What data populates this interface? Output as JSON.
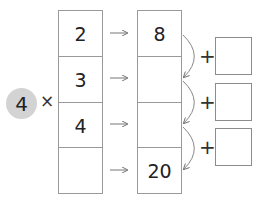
{
  "multiplier": {
    "value": "4",
    "operator": "×"
  },
  "left_column": [
    "2",
    "3",
    "4",
    ""
  ],
  "right_column": [
    "8",
    "",
    "",
    "20"
  ],
  "arrow_glyph": "→",
  "addition_boxes": [
    {
      "operator": "+",
      "value": ""
    },
    {
      "operator": "+",
      "value": ""
    },
    {
      "operator": "+",
      "value": ""
    }
  ],
  "colors": {
    "circle": "#d3d3d3",
    "border": "#9a9a9a",
    "arrow": "#888888"
  }
}
